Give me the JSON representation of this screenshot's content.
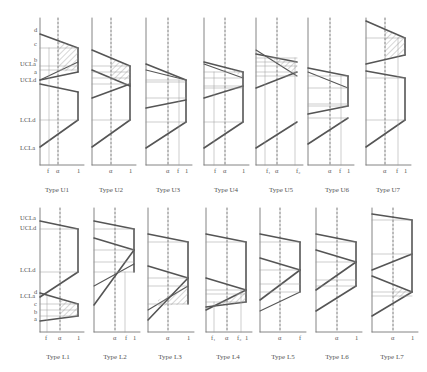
{
  "figure": {
    "upper_row": {
      "captions": [
        "Type U1",
        "Type U2",
        "Type U3",
        "Type U4",
        "Type U5",
        "Type U6",
        "Type U7"
      ],
      "y_labels_panel1": [
        "d",
        "c",
        "UCLa",
        "b",
        "a",
        "UCLd",
        "LCLd",
        "LCLa"
      ]
    },
    "lower_row": {
      "captions": [
        "Type L1",
        "Type L2",
        "Type L3",
        "Type L4",
        "Type L5",
        "Type L6",
        "Type L7"
      ],
      "y_labels_panel1": [
        "UCLa",
        "UCLd",
        "LCLd",
        "d",
        "LCLa",
        "c",
        "b",
        "a"
      ]
    },
    "x_tick_labels": {
      "U1": [
        "f",
        "α",
        "1"
      ],
      "U2": [
        "α",
        "1"
      ],
      "U3": [
        "α",
        "f",
        "1"
      ],
      "U4": [
        "f",
        "α",
        "1"
      ],
      "U5": [
        "f₁",
        "α",
        "f₂"
      ],
      "U6": [
        "α",
        "f",
        "1"
      ],
      "U7": [
        "α",
        "f",
        "1"
      ],
      "L1": [
        "f",
        "α",
        "1"
      ],
      "L2": [
        "α",
        "f",
        "1"
      ],
      "L3": [
        "α",
        "1"
      ],
      "L4": [
        "f₁",
        "α",
        "f₂",
        "1"
      ],
      "L5": [
        "α",
        "f"
      ],
      "L6": [
        "α",
        "1"
      ],
      "L7": [
        "α",
        "1"
      ]
    },
    "colors": {
      "line": "#555555",
      "grid": "#9a9a9a",
      "hatch": "#8a8a8a"
    }
  }
}
